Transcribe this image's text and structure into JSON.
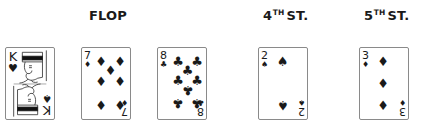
{
  "headers": {
    "flop": "FLOP",
    "fourth_num": "4",
    "fourth_sup": "TH",
    "fourth_rest": "ST.",
    "fifth_num": "5",
    "fifth_sup": "TH",
    "fifth_rest": "ST."
  },
  "cards": [
    {
      "rank": "K",
      "suit": "♥",
      "corner_suit_bottom": "♠",
      "label": "King"
    },
    {
      "rank": "7",
      "suit": "♦",
      "label": "Seven of diamonds"
    },
    {
      "rank": "8",
      "suit": "♣",
      "label": "Eight of clubs"
    },
    {
      "rank": "2",
      "suit": "♠",
      "label": "Two of spades"
    },
    {
      "rank": "3",
      "suit": "♦",
      "label": "Three of diamonds"
    }
  ],
  "pips": {
    "seven": [
      "♦",
      "♦",
      "♦",
      "♦",
      "♦",
      "♦",
      "♦"
    ],
    "eight": [
      "♣",
      "♣",
      "♣",
      "♣",
      "♣",
      "♣",
      "♣",
      "♣"
    ],
    "two": [
      "♠",
      "♠"
    ],
    "three": [
      "♦",
      "♦",
      "♦"
    ]
  }
}
